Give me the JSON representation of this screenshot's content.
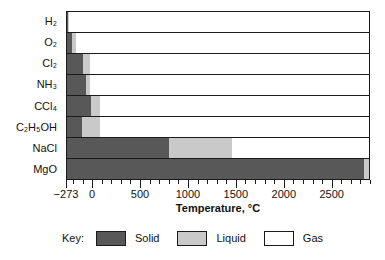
{
  "chart_data": {
    "type": "bar",
    "title": "",
    "subtitle": "",
    "xlabel": "Temperature, °C",
    "ylabel": "",
    "xlim": [
      -273,
      2900
    ],
    "grid": false,
    "orientation": "horizontal",
    "stacked": true,
    "legend_position": "bottom",
    "legend_title": "Key:",
    "xticks": [
      -273,
      0,
      500,
      1000,
      1500,
      2000,
      2500
    ],
    "xticklabels": [
      "−273",
      "0",
      "500",
      "1000",
      "1500",
      "2000",
      "2500"
    ],
    "minor_tick_step": 100,
    "categories": [
      "H2",
      "O2",
      "Cl2",
      "NH3",
      "CCl4",
      "C2H5OH",
      "NaCl",
      "MgO"
    ],
    "category_labels": [
      "H₂",
      "O₂",
      "Cl₂",
      "NH₃",
      "CCl₄",
      "C₂H₅OH",
      "NaCl",
      "MgO"
    ],
    "series": [
      {
        "name": "Solid",
        "color": "#585858",
        "values": [
          -259,
          -218,
          -101,
          -78,
          -23,
          -114,
          801,
          2852
        ]
      },
      {
        "name": "Liquid",
        "color": "#c9c9c9",
        "values": [
          -253,
          -183,
          -34,
          -33,
          77,
          78,
          1465,
          2900
        ]
      },
      {
        "name": "Gas",
        "color": "#ffffff",
        "values": [
          2900,
          2900,
          2900,
          2900,
          2900,
          2900,
          2900,
          2900
        ]
      }
    ],
    "rows": [
      {
        "label": "H₂",
        "melting": -259,
        "boiling": -253
      },
      {
        "label": "O₂",
        "melting": -218,
        "boiling": -183
      },
      {
        "label": "Cl₂",
        "melting": -101,
        "boiling": -34
      },
      {
        "label": "NH₃",
        "melting": -78,
        "boiling": -33
      },
      {
        "label": "CCl₄",
        "melting": -23,
        "boiling": 77
      },
      {
        "label": "C₂H₅OH",
        "melting": -114,
        "boiling": 78
      },
      {
        "label": "NaCl",
        "melting": 801,
        "boiling": 1465
      },
      {
        "label": "MgO",
        "melting": 2852,
        "boiling": 3600
      }
    ],
    "legend": [
      {
        "label": "Solid",
        "color": "#585858",
        "name": "solid"
      },
      {
        "label": "Liquid",
        "color": "#c9c9c9",
        "name": "liquid"
      },
      {
        "label": "Gas",
        "color": "#ffffff",
        "name": "gas"
      }
    ]
  },
  "colors": {
    "solid": "#585858",
    "liquid": "#c9c9c9",
    "gas": "#ffffff",
    "axis": "#1a1a1a",
    "background": "#ffffff"
  }
}
